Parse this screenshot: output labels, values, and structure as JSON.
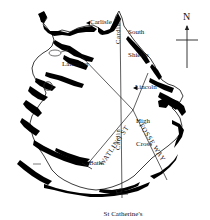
{
  "figure": {
    "type": "historical-map",
    "region": "Britain",
    "background_color": "#ffffff",
    "ink_color": "#111111",
    "coast_fill": "#000000"
  },
  "compass": {
    "north_letter": "N",
    "style": "vertical-line-with-crossbar"
  },
  "place_labels": [
    {
      "id": "carlisle",
      "text": "Carlisle",
      "lines": [
        "Carlisle"
      ]
    },
    {
      "id": "south-shields",
      "text": "South Shields",
      "lines": [
        "South",
        "Shields"
      ]
    },
    {
      "id": "lancaster",
      "text": "Lancaster",
      "lines": [
        "Lancaster"
      ]
    },
    {
      "id": "lincoln",
      "text": "Lincoln",
      "lines": [
        "Lincoln"
      ]
    },
    {
      "id": "high-cross",
      "text": "High Cross",
      "lines": [
        "High",
        "Cross"
      ]
    },
    {
      "id": "bath",
      "text": "Bath",
      "lines": [
        "Bath"
      ]
    },
    {
      "id": "st-catherines-point",
      "text": "St Catherine's Point",
      "lines": [
        "St Catherine's",
        "Point"
      ]
    }
  ],
  "road_labels": [
    {
      "id": "watling-street",
      "text": "WATLING ST"
    },
    {
      "id": "fosse-way",
      "text": "FOSSE WAY"
    },
    {
      "id": "cardin-north",
      "text": "Cardin"
    },
    {
      "id": "cardin-south",
      "text": "Cardin"
    }
  ],
  "labels": {
    "carlisle": "Carlisle",
    "south_shields_l1": "South",
    "south_shields_l2": "Shields",
    "lancaster": "Lancaster",
    "lincoln": "Lincoln",
    "high_cross_l1": "High",
    "high_cross_l2": "Cross",
    "bath": "Bath",
    "st_catherines_l1": "St Catherine's",
    "st_catherines_l2": "Point",
    "watling_st": "WATLING ST",
    "fosse_way": "FOSSE WAY",
    "cardin_north": "Cardin",
    "cardin_south": "Cardin",
    "north": "N"
  },
  "route_lines": [
    {
      "id": "meridian",
      "from": "South Shields",
      "to": "St Catherine's Point",
      "label": "Cardin"
    },
    {
      "id": "watling-street",
      "from": "Lancaster",
      "to": "High Cross",
      "label": "WATLING ST"
    },
    {
      "id": "watling-street-sw",
      "from": "High Cross",
      "to": "Bath",
      "label": "WATLING ST"
    },
    {
      "id": "fosse-way",
      "from": "High Cross",
      "to": "south-east coast",
      "label": "FOSSE WAY"
    },
    {
      "id": "lincoln-spur",
      "from": "High Cross",
      "to": "Lincoln",
      "label": ""
    }
  ]
}
